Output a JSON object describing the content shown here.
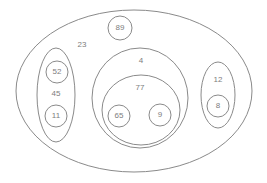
{
  "diagram": {
    "type": "nested-set-ellipse-diagram",
    "background_color": "#ffffff",
    "stroke_color": "#8a8a8a",
    "label_color": "#7d7d7d",
    "canvas": {
      "width": 267,
      "height": 183
    },
    "nodes": {
      "outer": {
        "label": "23",
        "shape": "ellipse",
        "cx": 134,
        "cy": 91,
        "rx": 118,
        "ry": 81,
        "label_x": 82,
        "label_y": 45
      },
      "left_group": {
        "label": "45",
        "shape": "ellipse",
        "cx": 56,
        "cy": 95,
        "rx": 19,
        "ry": 47,
        "label_x": 56,
        "label_y": 94
      },
      "left_child_top": {
        "label": "52",
        "shape": "circle",
        "cx": 57,
        "cy": 72,
        "r": 11,
        "label_x": 57,
        "label_y": 72
      },
      "left_child_bottom": {
        "label": "11",
        "shape": "circle",
        "cx": 56,
        "cy": 116,
        "r": 11,
        "label_x": 56,
        "label_y": 116
      },
      "top_circle": {
        "label": "89",
        "shape": "circle",
        "cx": 120,
        "cy": 28,
        "r": 12,
        "label_x": 120,
        "label_y": 28
      },
      "center_group": {
        "label": "4",
        "shape": "ellipse",
        "cx": 140,
        "cy": 98,
        "rx": 48,
        "ry": 50,
        "label_x": 141,
        "label_y": 61
      },
      "center_inner": {
        "label": "77",
        "shape": "ellipse",
        "cx": 141,
        "cy": 110,
        "rx": 39,
        "ry": 35,
        "label_x": 140,
        "label_y": 88
      },
      "center_child_left": {
        "label": "65",
        "shape": "circle",
        "cx": 119,
        "cy": 116,
        "r": 11,
        "label_x": 119,
        "label_y": 116
      },
      "center_child_right": {
        "label": "9",
        "shape": "circle",
        "cx": 160,
        "cy": 115,
        "r": 11,
        "label_x": 160,
        "label_y": 115
      },
      "right_group": {
        "label": "12",
        "shape": "ellipse",
        "cx": 218,
        "cy": 95,
        "rx": 17,
        "ry": 33,
        "label_x": 218,
        "label_y": 80
      },
      "right_child": {
        "label": "8",
        "shape": "circle",
        "cx": 218,
        "cy": 106,
        "r": 11,
        "label_x": 218,
        "label_y": 106
      }
    }
  }
}
